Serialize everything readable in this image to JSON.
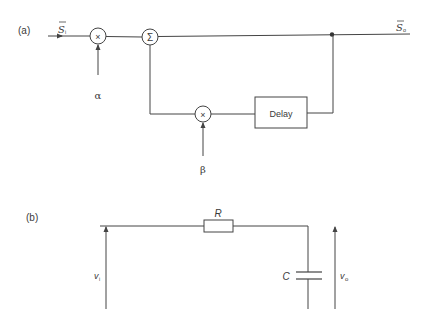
{
  "figure_a": {
    "label": "(a)",
    "input_signal": "S",
    "input_sub": "i",
    "output_signal": "S",
    "output_sub": "o",
    "multiplier_symbol": "×",
    "summer_symbol": "Σ",
    "feedback_multiplier_symbol": "×",
    "alpha": "α",
    "beta": "β",
    "delay_label": "Delay"
  },
  "figure_b": {
    "label": "(b)",
    "resistor_label": "R",
    "capacitor_label": "C",
    "input_voltage": "v",
    "input_sub": "i",
    "output_voltage": "v",
    "output_sub": "o"
  },
  "colors": {
    "line": "#444444",
    "text": "#3a3a3a",
    "background": "#ffffff"
  }
}
